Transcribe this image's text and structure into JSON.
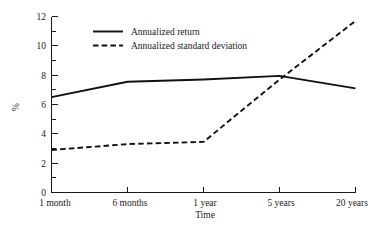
{
  "chart_data": {
    "type": "line",
    "title": "",
    "subtitle": "",
    "xlabel": "Time",
    "ylabel": "%",
    "categories": [
      "1 month",
      "6 months",
      "1 year",
      "5 years",
      "20 years"
    ],
    "series": [
      {
        "name": "Annualized return",
        "style": "solid",
        "values": [
          6.5,
          7.55,
          7.7,
          7.95,
          7.1
        ]
      },
      {
        "name": "Annualized standard deviation",
        "style": "dashed",
        "values": [
          2.9,
          3.3,
          3.45,
          7.7,
          11.7
        ]
      }
    ],
    "ylim": [
      0,
      12
    ],
    "yticks": [
      0,
      2,
      4,
      6,
      8,
      10,
      12
    ],
    "ytick_labels": [
      "0",
      "2",
      "4",
      "6",
      "8",
      "10",
      "12"
    ],
    "xtick_labels": [
      "1 month",
      "6 months",
      "1 year",
      "5 years",
      "20 years"
    ],
    "grid": false,
    "legend_position": "top-left-inside",
    "line_color": "#111111",
    "axis_color": "#1a1a1a",
    "background_color": "#ffffff"
  },
  "axes": {
    "y_label": "%",
    "x_label": "Time",
    "y_ticks": [
      "12",
      "10",
      "8",
      "6",
      "4",
      "2",
      "0"
    ],
    "x_ticks": [
      "1 month",
      "6 months",
      "1 year",
      "5 years",
      "20 years"
    ]
  },
  "legend": {
    "entries": [
      {
        "label": "Annualized return",
        "style": "solid"
      },
      {
        "label": "Annualized standard deviation",
        "style": "dashed"
      }
    ]
  }
}
